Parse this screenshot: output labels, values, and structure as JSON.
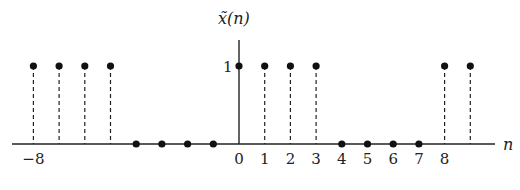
{
  "chart_data": {
    "type": "stem",
    "title": "x̃(n)",
    "xlabel": "n",
    "ylabel": "x̃(n)",
    "x": [
      -8,
      -7,
      -6,
      -5,
      -4,
      -3,
      -2,
      -1,
      0,
      1,
      2,
      3,
      4,
      5,
      6,
      7,
      8,
      9
    ],
    "values": [
      1,
      1,
      1,
      1,
      0,
      0,
      0,
      0,
      1,
      1,
      1,
      1,
      0,
      0,
      0,
      0,
      1,
      1
    ],
    "x_tick_labels": [
      {
        "n": -8,
        "label": "−8"
      },
      {
        "n": 0,
        "label": "0"
      },
      {
        "n": 1,
        "label": "1"
      },
      {
        "n": 2,
        "label": "2"
      },
      {
        "n": 3,
        "label": "3"
      },
      {
        "n": 4,
        "label": "4"
      },
      {
        "n": 5,
        "label": "5"
      },
      {
        "n": 6,
        "label": "6"
      },
      {
        "n": 7,
        "label": "7"
      },
      {
        "n": 8,
        "label": "8"
      }
    ],
    "y_tick_labels": [
      {
        "y": 1,
        "label": "1"
      }
    ],
    "stem_style": "dashed",
    "grid": false,
    "legend": null,
    "xlim": [
      -9,
      10
    ],
    "ylim": [
      0,
      1.4
    ]
  },
  "labels": {
    "y_axis": "x̃(n)",
    "x_axis": "n",
    "y_one": "1"
  }
}
